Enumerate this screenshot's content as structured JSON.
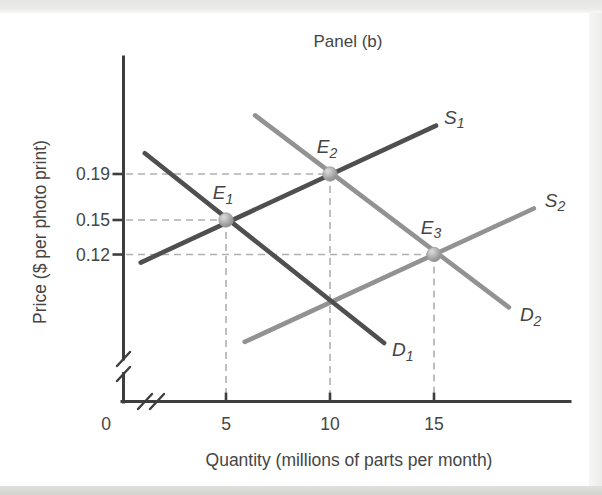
{
  "title": "Panel (b)",
  "axes": {
    "x": {
      "label": "Quantity (millions of parts per month)",
      "has_break": true,
      "ticks": [
        {
          "value": 0,
          "label": "0"
        },
        {
          "value": 5,
          "label": "5"
        },
        {
          "value": 10,
          "label": "10"
        },
        {
          "value": 15,
          "label": "15"
        }
      ]
    },
    "y": {
      "label": "Price ($ per photo print)",
      "has_break": true,
      "ticks": [
        {
          "value": 0.19,
          "label": "0.19"
        },
        {
          "value": 0.15,
          "label": "0.15"
        },
        {
          "value": 0.12,
          "label": "0.12"
        }
      ]
    }
  },
  "colors": {
    "dark_curve": "#4f4f4f",
    "light_curve": "#929292",
    "dashed_guide": "#b0b0b0",
    "axis": "#3e3e3e",
    "text": "#454545",
    "marker_fill": "#a9a9a9"
  },
  "chart_data": {
    "type": "line",
    "title": "Panel (b)",
    "xlabel": "Quantity (millions of parts per month)",
    "ylabel": "Price ($ per photo print)",
    "x_ticks": [
      0,
      5,
      10,
      15
    ],
    "y_ticks": [
      0.19,
      0.15,
      0.12
    ],
    "xlim": [
      0,
      21
    ],
    "ylim": [
      0.03,
      0.26
    ],
    "grid": false,
    "axis_breaks": {
      "x": true,
      "y": true
    },
    "series": [
      {
        "name": "S1",
        "label_main": "S",
        "label_sub": "1",
        "kind": "supply",
        "color": "#4f4f4f",
        "points": [
          [
            0.9,
            0.113
          ],
          [
            15.1,
            0.232
          ]
        ]
      },
      {
        "name": "S2",
        "label_main": "S",
        "label_sub": "2",
        "kind": "supply",
        "color": "#929292",
        "points": [
          [
            5.9,
            0.044
          ],
          [
            19.8,
            0.16
          ]
        ]
      },
      {
        "name": "D1",
        "label_main": "D",
        "label_sub": "1",
        "kind": "demand",
        "color": "#4f4f4f",
        "points": [
          [
            1.1,
            0.208
          ],
          [
            12.6,
            0.043
          ]
        ]
      },
      {
        "name": "D2",
        "label_main": "D",
        "label_sub": "2",
        "kind": "demand",
        "color": "#929292",
        "points": [
          [
            6.4,
            0.241
          ],
          [
            18.6,
            0.074
          ]
        ]
      }
    ],
    "equilibria": [
      {
        "name": "E1",
        "label_main": "E",
        "label_sub": "1",
        "quantity": 5,
        "price": 0.15
      },
      {
        "name": "E2",
        "label_main": "E",
        "label_sub": "2",
        "quantity": 10,
        "price": 0.19
      },
      {
        "name": "E3",
        "label_main": "E",
        "label_sub": "3",
        "quantity": 15,
        "price": 0.12
      }
    ]
  }
}
